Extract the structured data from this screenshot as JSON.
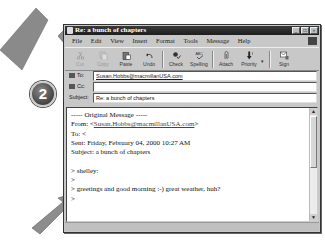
{
  "window": {
    "title": "Re: a bunch of chapters",
    "controls": [
      "_",
      "□",
      "×"
    ]
  },
  "menu": {
    "items": [
      "File",
      "Edit",
      "View",
      "Insert",
      "Format",
      "Tools",
      "Message",
      "Help"
    ]
  },
  "toolbar": {
    "buttons": [
      {
        "label": "Cut",
        "icon": "scissors-icon",
        "enabled": false
      },
      {
        "label": "Copy",
        "icon": "copy-icon",
        "enabled": false
      },
      {
        "label": "Paste",
        "icon": "paste-icon",
        "enabled": true
      },
      {
        "label": "Undo",
        "icon": "undo-icon",
        "enabled": true
      },
      {
        "label": "Check",
        "icon": "check-names-icon",
        "enabled": true
      },
      {
        "label": "Spelling",
        "icon": "spelling-icon",
        "enabled": true
      },
      {
        "label": "Attach",
        "icon": "paperclip-icon",
        "enabled": true
      },
      {
        "label": "Priority",
        "icon": "priority-icon",
        "enabled": true
      },
      {
        "label": "Sign",
        "icon": "sign-icon",
        "enabled": true
      }
    ]
  },
  "fields": {
    "to_label": "To:",
    "to_value": "Susan.Hobbs@macmillanUSA.com",
    "cc_label": "Cc:",
    "cc_value": "",
    "subject_label": "Subject:",
    "subject_value": "Re: a bunch of chapters"
  },
  "body": {
    "lines": [
      "----- Original Message -----",
      "From: <Susan.Hobbs@macmillanUSA.com>",
      "To: <",
      "Sent: Friday, February 04, 2000 10:27 AM",
      "Subject: a bunch of chapters",
      "",
      "> shelley:",
      ">",
      "> greetings and good morning :-) great weather, huh?",
      ">"
    ],
    "from_prefix": "From: <",
    "from_email": "Susan.Hobbs@macmillanUSA.com",
    "from_suffix": ">"
  },
  "callout": {
    "step_number": "2"
  }
}
